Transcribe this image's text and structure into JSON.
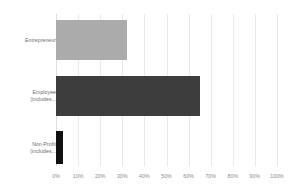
{
  "chart_data": {
    "type": "bar",
    "orientation": "horizontal",
    "title": "",
    "subtitle": "",
    "xlabel": "",
    "ylabel": "",
    "xlim": [
      0,
      100
    ],
    "grid": true,
    "legend": false,
    "categories": [
      "Entrepreneur",
      "Employee (includes...",
      "Non-Profit (includes..."
    ],
    "values": [
      32,
      65,
      3
    ],
    "bar_colors": [
      "#ababab",
      "#3d3d3d",
      "#111111"
    ],
    "xticks": [
      0,
      10,
      20,
      30,
      40,
      50,
      60,
      70,
      80,
      90,
      100
    ],
    "xtick_labels": [
      "0%",
      "10%",
      "20%",
      "30%",
      "40%",
      "50%",
      "60%",
      "70%",
      "80%",
      "90%",
      "100%"
    ],
    "background_color": "#ffffff",
    "gridline_color": "#e9e9e9",
    "label_color": "#6d6d6d",
    "tick_label_color": "#8a8a8a"
  },
  "bars": [
    {
      "label": "Entrepreneur",
      "value": 32,
      "color": "#ababab",
      "top": 6,
      "height": 40
    },
    {
      "label": "Employee (includes...",
      "value": 65,
      "color": "#3d3d3d",
      "top": 62,
      "height": 40
    },
    {
      "label": "Non-Profit (includes...",
      "value": 3,
      "color": "#111111",
      "top": 117,
      "height": 33
    }
  ]
}
